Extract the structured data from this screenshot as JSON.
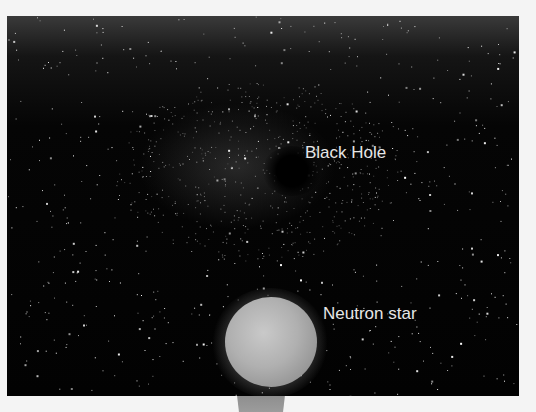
{
  "figure": {
    "background_color": "#020202",
    "labels": {
      "black_hole": "Black Hole",
      "neutron_star": "Neutron star"
    },
    "label_color": "#e6e6e6",
    "neutron_star_color": "#b0b0b0"
  }
}
